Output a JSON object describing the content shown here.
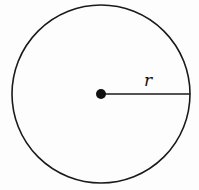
{
  "diagram": {
    "type": "circle-with-radius",
    "circle": {
      "cx": 101,
      "cy": 94,
      "r": 89
    },
    "center_point": {
      "x": 101,
      "y": 94
    },
    "radius_label": "r",
    "colors": {
      "stroke": "#1a1a1a",
      "background": "#fdfdfd"
    }
  }
}
